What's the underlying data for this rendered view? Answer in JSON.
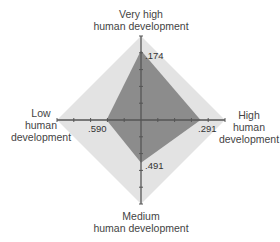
{
  "chart_data": {
    "type": "radar",
    "title": "",
    "axes": [
      {
        "key": "very_high",
        "label_lines": [
          "Very high",
          "human development"
        ],
        "value": 0.174,
        "value_label": ".174"
      },
      {
        "key": "high",
        "label_lines": [
          "High",
          "human",
          "development"
        ],
        "value": 0.291,
        "value_label": ".291"
      },
      {
        "key": "medium",
        "label_lines": [
          "Medium",
          "human development"
        ],
        "value": 0.491,
        "value_label": ".491"
      },
      {
        "key": "low",
        "label_lines": [
          "Low",
          "human",
          "development"
        ],
        "value": 0.59,
        "value_label": ".590"
      }
    ],
    "scale": {
      "min": 0,
      "max": 1,
      "tick_step": 0.2,
      "plotted_as": "1 - value (distance from outer edge)"
    },
    "grid": false,
    "legend": null,
    "colors": {
      "outer_area": "#e3e3e3",
      "inner_area": "#8c8c8c",
      "axis": "#555555",
      "text": "#444444"
    }
  },
  "labels": {
    "very_high_1": "Very high",
    "very_high_2": "human development",
    "high_1": "High",
    "high_2": "human",
    "high_3": "development",
    "medium_1": "Medium",
    "medium_2": "human development",
    "low_1": "Low",
    "low_2": "human",
    "low_3": "development"
  },
  "values": {
    "very_high": ".174",
    "high": ".291",
    "medium": ".491",
    "low": ".590"
  }
}
